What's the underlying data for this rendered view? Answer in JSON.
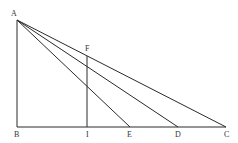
{
  "diagram": {
    "type": "geometry",
    "points": {
      "A": {
        "x": 17,
        "y": 20
      },
      "B": {
        "x": 17,
        "y": 127
      },
      "I": {
        "x": 87,
        "y": 127
      },
      "F": {
        "x": 87,
        "y": 56
      },
      "E": {
        "x": 130,
        "y": 127
      },
      "D": {
        "x": 178,
        "y": 127
      },
      "C": {
        "x": 226,
        "y": 127
      }
    },
    "labels": {
      "A": "A",
      "B": "B",
      "C": "C",
      "D": "D",
      "E": "E",
      "F": "F",
      "I": "I"
    },
    "segments": [
      [
        "A",
        "B"
      ],
      [
        "B",
        "C"
      ],
      [
        "A",
        "C"
      ],
      [
        "A",
        "D"
      ],
      [
        "A",
        "E"
      ],
      [
        "F",
        "I"
      ]
    ],
    "line_color": "#2a2a2a",
    "label_color": "#333333"
  }
}
